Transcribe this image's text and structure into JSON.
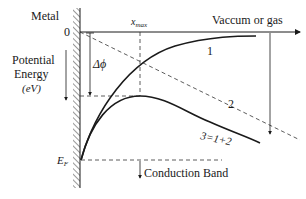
{
  "diagram": {
    "labels": {
      "metal": "Metal",
      "zero": "0",
      "vacuum": "Vaccum or gas",
      "x_max": "x",
      "x_max_sub": "max",
      "delta_phi": "Δϕ",
      "potential_line1": "Potential",
      "potential_line2": "Energy",
      "potential_line3": "(eV)",
      "fermi": "E",
      "fermi_sub": "F",
      "conduction_band": "Conduction Band",
      "curve1": "1",
      "curve2": "2",
      "curve3": "3=1+2"
    },
    "colors": {
      "line": "#1a1a1a",
      "dashed": "#333333",
      "background": "#ffffff"
    }
  }
}
